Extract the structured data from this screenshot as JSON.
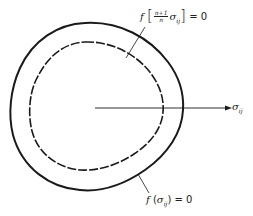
{
  "diagram": {
    "type": "yield-surface",
    "outer_surface": {
      "style": "solid",
      "label": {
        "func": "f",
        "open": "(",
        "sigma": "σ",
        "sub": "ij",
        "close": ")",
        "rhs": "= 0"
      }
    },
    "inner_surface": {
      "style": "dashed",
      "label": {
        "func": "f",
        "lbracket": "[",
        "frac_num": "n+1",
        "frac_den": "n",
        "sigma": "σ",
        "sub": "ij",
        "rbracket": "]",
        "rhs": "= 0"
      }
    },
    "axis": {
      "sigma": "σ",
      "sub": "ij"
    },
    "colors": {
      "stroke": "#1a1a1a",
      "background": "#ffffff"
    }
  }
}
